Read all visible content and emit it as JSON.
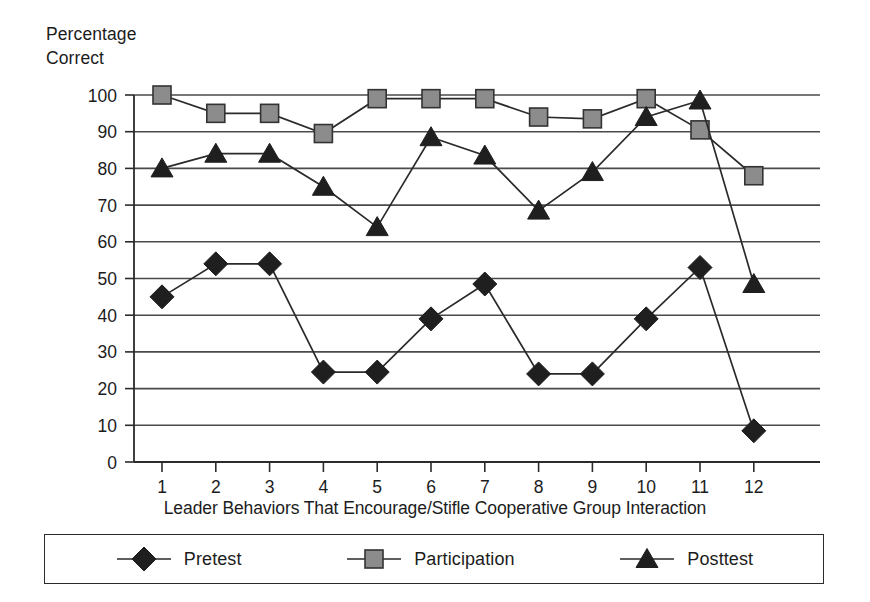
{
  "chart_data": {
    "type": "line",
    "title": "",
    "xlabel": "Leader Behaviors That Encourage/Stifle Cooperative Group Interaction",
    "ylabel": "Percentage\nCorrect",
    "categories": [
      "1",
      "2",
      "3",
      "4",
      "5",
      "6",
      "7",
      "8",
      "9",
      "10",
      "11",
      "12"
    ],
    "x": [
      1,
      2,
      3,
      4,
      5,
      6,
      7,
      8,
      9,
      10,
      11,
      12
    ],
    "ylim": [
      0,
      100
    ],
    "yticks": [
      0,
      10,
      20,
      30,
      40,
      50,
      60,
      70,
      80,
      90,
      100
    ],
    "ytick_labels": [
      "0",
      "10",
      "20",
      "30",
      "40",
      "50",
      "60",
      "70",
      "80",
      "90",
      "100"
    ],
    "grid": "horizontal",
    "legend_position": "bottom",
    "series": [
      {
        "name": "Pretest",
        "marker": "diamond",
        "color": "#1f1f1f",
        "values": [
          45,
          54,
          54,
          24.5,
          24.5,
          39,
          48.5,
          24,
          24,
          39,
          53,
          8.5
        ]
      },
      {
        "name": "Participation",
        "marker": "square",
        "color": "#8c8c8c",
        "values": [
          100,
          95,
          95,
          89.5,
          99,
          99,
          99,
          94,
          93.5,
          99,
          90.5,
          78
        ]
      },
      {
        "name": "Posttest",
        "marker": "triangle",
        "color": "#1f1f1f",
        "values": [
          80,
          84,
          84,
          75,
          64,
          88.5,
          83.5,
          68.5,
          79,
          94,
          98.5,
          48.5
        ]
      }
    ]
  },
  "legend": {
    "items": [
      {
        "label": "Pretest",
        "marker": "diamond-marker-icon"
      },
      {
        "label": "Participation",
        "marker": "square-marker-icon"
      },
      {
        "label": "Posttest",
        "marker": "triangle-marker-icon"
      }
    ]
  }
}
